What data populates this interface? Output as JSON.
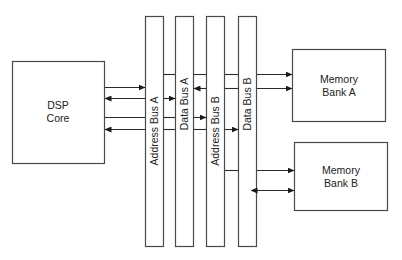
{
  "diagram": {
    "blocks": {
      "dsp_core": {
        "line1": "DSP",
        "line2": "Core"
      },
      "memory_a": {
        "line1": "Memory",
        "line2": "Bank A"
      },
      "memory_b": {
        "line1": "Memory",
        "line2": "Bank B"
      }
    },
    "buses": [
      {
        "label": "Address Bus A"
      },
      {
        "label": "Data Bus A"
      },
      {
        "label": "Address Bus B"
      },
      {
        "label": "Data Bus B"
      }
    ],
    "colors": {
      "stroke": "#4a4a4a",
      "text": "#222222",
      "background": "#ffffff"
    }
  }
}
